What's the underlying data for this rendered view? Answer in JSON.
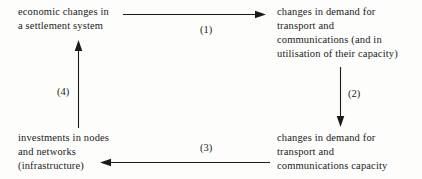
{
  "diagram": {
    "background_color": "#fdfdfc",
    "ink_color": "#1b1b1b",
    "nodes": [
      {
        "id": "node-economic-changes",
        "position": "top-left",
        "lines": [
          "economic changes in",
          "a settlement system"
        ]
      },
      {
        "id": "node-demand-transport-communications",
        "position": "top-right",
        "lines": [
          "changes in demand for",
          "transport and",
          "communications (and in",
          "utilisation of their capacity)"
        ]
      },
      {
        "id": "node-investments-infrastructure",
        "position": "bottom-left",
        "lines": [
          "investments in nodes",
          "and networks",
          "(infrastructure)"
        ]
      },
      {
        "id": "node-demand-capacity",
        "position": "bottom-right",
        "lines": [
          "changes in demand for",
          "transport and",
          "communications capacity"
        ]
      }
    ],
    "edges": [
      {
        "id": "edge-1",
        "label": "(1)",
        "direction": "right",
        "from": "node-economic-changes",
        "to": "node-demand-transport-communications"
      },
      {
        "id": "edge-2",
        "label": "(2)",
        "direction": "down",
        "from": "node-demand-transport-communications",
        "to": "node-demand-capacity"
      },
      {
        "id": "edge-3",
        "label": "(3)",
        "direction": "left",
        "from": "node-demand-capacity",
        "to": "node-investments-infrastructure"
      },
      {
        "id": "edge-4",
        "label": "(4)",
        "direction": "up",
        "from": "node-investments-infrastructure",
        "to": "node-economic-changes"
      }
    ]
  }
}
